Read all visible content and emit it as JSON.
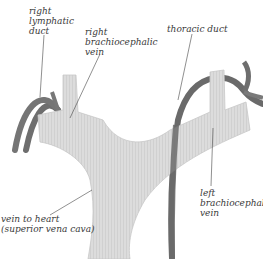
{
  "diagram": {
    "colors": {
      "vein_fill": "#d9d9d9",
      "vein_stroke": "#c4c4c4",
      "duct": "#6e6e6e",
      "leader_line": "#444444",
      "label_text": "#3a3a3a"
    },
    "labels": {
      "right_lymphatic_duct": "right\nlymphatic\nduct",
      "right_brachiocephalic_vein": "right\nbrachiocephalic\nvein",
      "thoracic_duct": "thoracic duct",
      "vein_to_heart": "vein to heart\n(superior vena cava)",
      "left_brachiocephalic_vein": "left\nbrachiocephalic\nvein"
    }
  }
}
